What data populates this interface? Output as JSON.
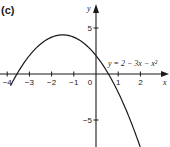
{
  "part_label": "(c)",
  "chart_data": {
    "type": "line",
    "title": "",
    "equation": "y = 2 − 3x − x²",
    "xlabel": "x",
    "ylabel": "y",
    "x_ticks": [
      -4,
      -3,
      -2,
      -1,
      0,
      1,
      2
    ],
    "x_tick_labels": [
      "−4",
      "−3",
      "−2",
      "−1",
      "0",
      "1",
      "2"
    ],
    "y_ticks": [
      5,
      -5
    ],
    "y_tick_labels": [
      "5",
      "−5"
    ],
    "xlim": [
      -4.3,
      3.3
    ],
    "ylim": [
      -7.8,
      7.5
    ],
    "grid": false,
    "series": [
      {
        "name": "y = 2 − 3x − x²",
        "x": [
          -3.8,
          -3.5,
          -3,
          -2.5,
          -2,
          -1.5,
          -1,
          -0.5,
          0,
          0.5,
          1,
          1.5,
          2,
          2.3
        ],
        "y": [
          -0.98,
          0.25,
          2,
          3.25,
          4,
          4.25,
          4,
          3.25,
          2,
          0.25,
          -2,
          -4.75,
          -8,
          -10.19
        ]
      }
    ],
    "annotations": [
      {
        "text": "y = 2 − 3x − x²",
        "position": "right of y-axis, just above x-axis"
      }
    ]
  },
  "colors": {
    "curve": "#1a1a1a",
    "axes": "#1a1a1a",
    "background": "#ffffff"
  }
}
